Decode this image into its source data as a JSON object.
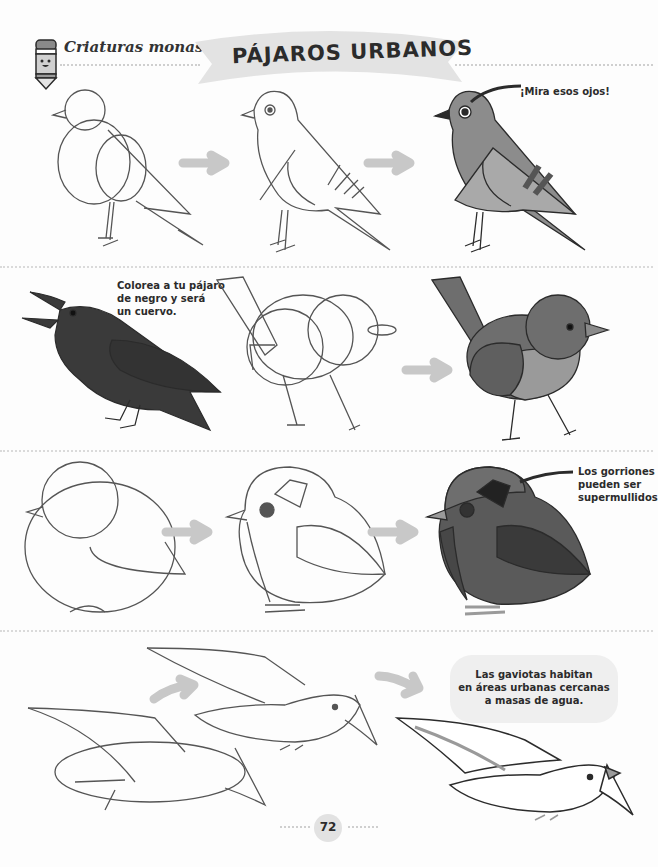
{
  "header": {
    "series_label": "Criaturas monas",
    "title": "PÁJAROS URBANOS",
    "mascot_icon": "crayon-mascot-icon"
  },
  "sections": [
    {
      "name": "pigeon",
      "steps": [
        "outline-sketch",
        "detailed-lineart",
        "colored"
      ],
      "note": "¡Mira esos ojos!"
    },
    {
      "name": "robin",
      "steps": [
        "crow-example",
        "outline-sketch",
        "colored"
      ],
      "note_lines": [
        "Colorea a tu pájaro",
        "de negro y será",
        "un cuervo."
      ]
    },
    {
      "name": "sparrow",
      "steps": [
        "outline-sketch",
        "detailed-lineart",
        "colored"
      ],
      "note_lines": [
        "Los gorriones",
        "pueden ser",
        "supermullidos"
      ]
    },
    {
      "name": "seagull",
      "steps": [
        "outline-sketch",
        "detailed-lineart",
        "colored"
      ],
      "note_lines": [
        "Las gaviotas habitan",
        "en áreas urbanas cercanas",
        "a masas de agua."
      ]
    }
  ],
  "footer": {
    "page_number": "72"
  },
  "colors": {
    "ink": "#2b2b2b",
    "banner": "#e3e3e3",
    "arrow": "#c8c8c8",
    "pigeon_body": "#8c8c8c",
    "crow_body": "#3a3a3a",
    "robin_body": "#6e6e6e",
    "sparrow_body": "#5a5a5a",
    "note_bubble": "#efefef"
  }
}
